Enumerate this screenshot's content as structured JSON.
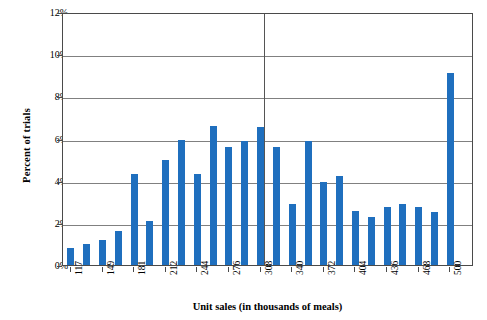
{
  "chart": {
    "type": "bar",
    "title": "",
    "xlabel": "Unit sales (in thousands of meals)",
    "ylabel": "Percent of trials",
    "bar_color": "#1f6fbe",
    "gridline_color": "#808080",
    "axis_color": "#4a4a4a",
    "reference_line_value": 308
  },
  "y_axis": {
    "labels": [
      "0%",
      "2%",
      "4%",
      "6%",
      "8%",
      "10%",
      "12%"
    ],
    "values": [
      0,
      2,
      4,
      6,
      8,
      10,
      12
    ],
    "min": 0,
    "max": 12,
    "step": 2,
    "grid": true
  },
  "x_axis": {
    "tick_labels": [
      "117",
      "149",
      "181",
      "212",
      "244",
      "276",
      "308",
      "340",
      "372",
      "404",
      "436",
      "468",
      "500"
    ],
    "tick_values": [
      117,
      149,
      181,
      212,
      244,
      276,
      308,
      340,
      372,
      404,
      436,
      468,
      500
    ],
    "rotated": true
  },
  "chart_data": {
    "type": "bar",
    "title": "",
    "xlabel": "Unit sales (in thousands of meals)",
    "ylabel": "Percent of trials",
    "ylim": [
      0,
      12
    ],
    "yticks": [
      0,
      2,
      4,
      6,
      8,
      10,
      12
    ],
    "ytick_labels": [
      "0%",
      "2%",
      "4%",
      "6%",
      "8%",
      "10%",
      "12%"
    ],
    "xticks": [
      117,
      149,
      181,
      212,
      244,
      276,
      308,
      340,
      372,
      404,
      436,
      468,
      500
    ],
    "xtick_labels": [
      "117",
      "149",
      "181",
      "212",
      "244",
      "276",
      "308",
      "340",
      "372",
      "404",
      "436",
      "468",
      "500"
    ],
    "grid": true,
    "legend": null,
    "annotations": [
      {
        "type": "vertical-line",
        "x": 308,
        "label": ""
      }
    ],
    "categories": [
      117,
      133,
      149,
      165,
      181,
      197,
      212,
      228,
      244,
      260,
      276,
      292,
      308,
      324,
      340,
      356,
      372,
      388,
      404,
      420,
      436,
      452,
      468,
      484,
      500,
      516
    ],
    "values": [
      0.8,
      1.0,
      1.2,
      1.6,
      4.3,
      2.1,
      5.0,
      5.95,
      4.3,
      6.6,
      5.6,
      5.9,
      6.55,
      5.6,
      2.9,
      5.9,
      3.95,
      4.2,
      2.55,
      2.3,
      2.75,
      2.9,
      2.75,
      2.5,
      9.1,
      0.0
    ]
  }
}
